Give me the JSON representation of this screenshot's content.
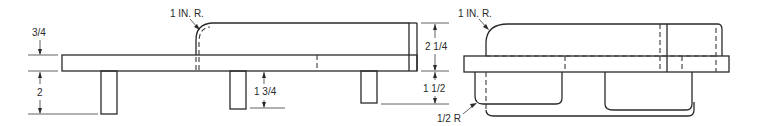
{
  "drawing": {
    "title": "Bench with back rest - front and side views",
    "views": [
      {
        "name": "front-view",
        "labels": {
          "seat_thickness": "3/4",
          "leg_height_left": "2",
          "back_radius": "1 IN. R.",
          "leg_height_mid": "1 3/4",
          "back_height": "2 1/4",
          "leg_height_right": "1 1/2"
        }
      },
      {
        "name": "side-view",
        "labels": {
          "top_radius": "1 IN. R.",
          "bottom_radius": "1/2 R"
        }
      }
    ]
  }
}
